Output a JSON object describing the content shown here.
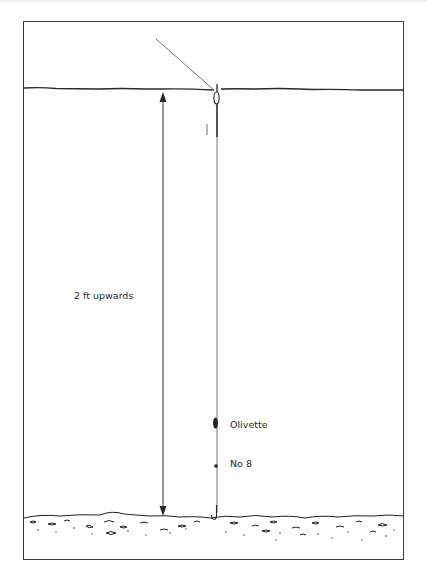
{
  "diagram": {
    "type": "fishing-rig-illustration",
    "labels": {
      "depth": "2 ft upwards",
      "olivette": "Olivette",
      "shot": "No 8"
    },
    "elements": [
      {
        "name": "water-surface",
        "kind": "wavy-line"
      },
      {
        "name": "rod-line",
        "kind": "diagonal-line"
      },
      {
        "name": "float",
        "kind": "pole-float"
      },
      {
        "name": "main-line",
        "kind": "vertical-line"
      },
      {
        "name": "olivette-weight",
        "kind": "elongated-weight"
      },
      {
        "name": "no8-shot",
        "kind": "split-shot"
      },
      {
        "name": "hook",
        "kind": "hook"
      },
      {
        "name": "depth-arrow",
        "kind": "double-headed-arrow"
      },
      {
        "name": "river-bed",
        "kind": "gravel-bed"
      }
    ],
    "colors": {
      "ink": "#2a2a2a",
      "line": "#555555",
      "background": "#ffffff"
    }
  }
}
